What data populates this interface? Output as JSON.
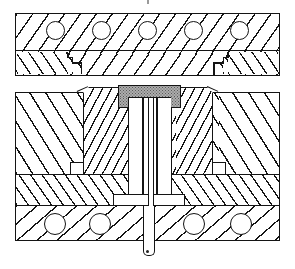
{
  "diagram": {
    "type": "technical-cross-section",
    "background_color": "#ffffff",
    "line_color": "#141414",
    "molded_part": {
      "name": "molded-part",
      "fill": "#adadad",
      "stipple_dot": "#5a5a5a"
    },
    "top_assembly": {
      "plates": [
        {
          "name": "top-clamp-plate",
          "hatch": "forward-diagonal",
          "hole_count": 5
        },
        {
          "name": "upper-cavity-plate",
          "hatch": "forward-diagonal",
          "end_caps_hatch": "back-diagonal",
          "stepped_joints": 2
        }
      ]
    },
    "bottom_assembly": {
      "blocks": [
        {
          "name": "cavity-block-outer-left",
          "hatch": "back-diagonal"
        },
        {
          "name": "cavity-insert-left",
          "hatch": "forward-diagonal-dense"
        },
        {
          "name": "cavity-insert-right",
          "hatch": "forward-diagonal-dense"
        },
        {
          "name": "cavity-block-outer-right",
          "hatch": "back-diagonal"
        },
        {
          "name": "support-plate",
          "hatch": "back-diagonal"
        },
        {
          "name": "base-plate",
          "hatch": "forward-diagonal",
          "hole_count": 4
        }
      ],
      "ejector": {
        "sleeve": "ejector-sleeve",
        "flange": "ejector-flange",
        "pin": "ejector-pin",
        "pin_tip": "rounded-below-base-plate"
      }
    }
  }
}
